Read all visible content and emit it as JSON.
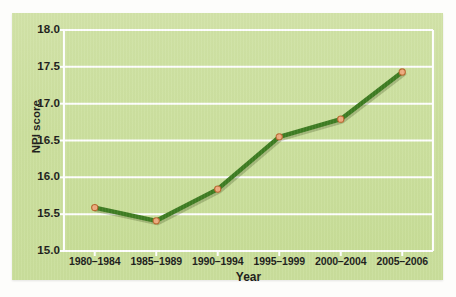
{
  "chart_data": {
    "type": "line",
    "title": "",
    "xlabel": "Year",
    "ylabel": "NPI score",
    "categories": [
      "1980–1984",
      "1985–1989",
      "1990–1994",
      "1995–1999",
      "2000–2004",
      "2005–2006"
    ],
    "values": [
      15.59,
      15.41,
      15.84,
      16.55,
      16.79,
      17.43
    ],
    "series": [
      {
        "name": "NPI score",
        "values": [
          15.59,
          15.41,
          15.84,
          16.55,
          16.79,
          17.43
        ]
      }
    ],
    "ylim": [
      15.0,
      18.0
    ],
    "ytick_values": [
      15.0,
      15.5,
      16.0,
      16.5,
      17.0,
      17.5,
      18.0
    ],
    "ytick_labels": [
      "15.0",
      "15.5",
      "16.0",
      "16.5",
      "17.0",
      "17.5",
      "18.0"
    ],
    "grid": "horizontal",
    "gridline_color": "#ffffff",
    "legend": "none",
    "line_color": "#3e7c22",
    "marker_face_color": "#edab7e",
    "marker_edge_color": "#b8682f",
    "plot_background": "#c9de9b",
    "card_background": "#cde0a0",
    "page_background": "#fdfdfb",
    "tick_label_color": "#1d1d1b"
  }
}
